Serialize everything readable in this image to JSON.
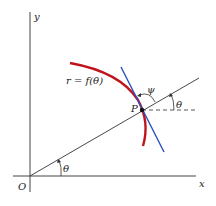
{
  "labels": {
    "y_axis": "y",
    "x_axis": "x",
    "origin": "O",
    "curve": "r = f(θ)",
    "point": "P",
    "psi": "ψ",
    "theta_origin": "θ",
    "theta_point": "θ"
  },
  "colors": {
    "curve": "#c0141c",
    "tangent": "#2a4fc0",
    "lines": "#333333"
  }
}
